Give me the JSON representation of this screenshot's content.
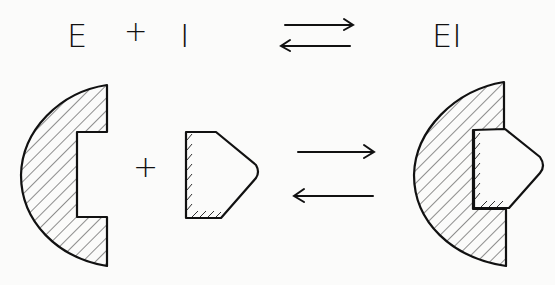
{
  "equation": {
    "enzyme": "E",
    "plus": "+",
    "inhibitor": "I",
    "complex": "EI"
  },
  "figure": {
    "plus": "+",
    "ink_color": "#111111",
    "background": "#fbfbfa"
  }
}
